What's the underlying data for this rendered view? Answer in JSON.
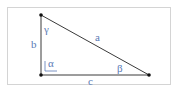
{
  "diagram": {
    "type": "right-triangle",
    "colors": {
      "edge": "#3a3a3a",
      "vertex": "#111111",
      "label": "#5a7ab5",
      "frame": "#d4d4d4"
    },
    "sides": {
      "a": "a",
      "b": "b",
      "c": "c"
    },
    "angles": {
      "alpha": "α",
      "beta": "β",
      "gamma": "γ"
    }
  }
}
